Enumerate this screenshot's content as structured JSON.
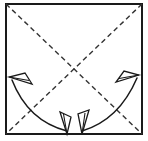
{
  "figure": {
    "canvas": {
      "width": 148,
      "height": 141,
      "background": "#ffffff"
    },
    "colors": {
      "outline": "#1a1a1a",
      "crease": "#333333",
      "arrow": "#1a1a1a",
      "paper_fill": "#ffffff"
    },
    "stroke_widths": {
      "outline": 1.6,
      "crease": 1.4,
      "arrow": 1.5
    },
    "dash_pattern": "5,3.5"
  },
  "paper": {
    "shape_name": "square-sheet",
    "left": 6,
    "top": 4,
    "right": 142,
    "bottom": 134,
    "width": 136,
    "height": 130
  },
  "creases": [
    {
      "name": "diagonal-crease-tl-br",
      "style": "dashed",
      "from": {
        "x": 6,
        "y": 4
      },
      "to": {
        "x": 142,
        "y": 134
      },
      "label": "valley fold diagonal (top-left to bottom-right)"
    },
    {
      "name": "diagonal-crease-tr-bl",
      "style": "dashed",
      "from": {
        "x": 142,
        "y": 4
      },
      "to": {
        "x": 6,
        "y": 134
      },
      "label": "valley fold diagonal (top-right to bottom-left)"
    }
  ],
  "crease_intersection": {
    "x": 74,
    "y": 69
  },
  "arrows": [
    {
      "name": "fold-arrow-left",
      "type": "curved-double-headed",
      "direction": "bottom-center to upper-left",
      "start": {
        "x": 67,
        "y": 133
      },
      "control": {
        "x": 28,
        "y": 120
      },
      "end": {
        "x": 12,
        "y": 79
      },
      "heads": [
        "start",
        "end"
      ],
      "head_start_angle_deg": 95,
      "head_end_angle_deg": 200
    },
    {
      "name": "fold-arrow-right",
      "type": "curved-double-headed",
      "direction": "bottom-center to upper-right",
      "start": {
        "x": 82,
        "y": 133
      },
      "control": {
        "x": 119,
        "y": 119
      },
      "end": {
        "x": 137,
        "y": 77
      },
      "heads": [
        "start",
        "end"
      ],
      "head_start_angle_deg": 85,
      "head_end_angle_deg": 340
    }
  ],
  "arrowheads": [
    {
      "name": "arrowhead-bottom-left",
      "tip": {
        "x": 67,
        "y": 134
      },
      "points": "down"
    },
    {
      "name": "arrowhead-bottom-right",
      "tip": {
        "x": 82,
        "y": 134
      },
      "points": "down"
    },
    {
      "name": "arrowhead-upper-left",
      "tip": {
        "x": 9,
        "y": 77
      },
      "points": "left-up"
    },
    {
      "name": "arrowhead-upper-right",
      "tip": {
        "x": 139,
        "y": 75
      },
      "points": "right-up"
    }
  ]
}
